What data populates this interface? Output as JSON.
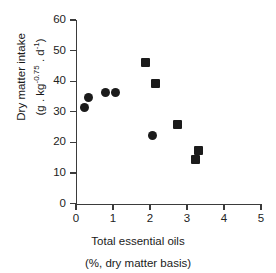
{
  "chart_data": {
    "type": "scatter",
    "title": "",
    "xlabel": "Total essential oils (%, dry matter basis)",
    "ylabel": "Dry matter intake (g . kg^-0.75 . d^-1)",
    "xlim": [
      0,
      5
    ],
    "ylim": [
      0,
      60
    ],
    "xticks": [
      0,
      1,
      2,
      3,
      4,
      5
    ],
    "yticks": [
      0,
      10,
      20,
      30,
      40,
      50,
      60
    ],
    "grid": false,
    "legend": "none",
    "series": [
      {
        "name": "circle-series",
        "marker": "circle",
        "color": "#1b1b1b",
        "points": [
          {
            "x": 0.22,
            "y": 31.3
          },
          {
            "x": 0.34,
            "y": 34.6
          },
          {
            "x": 0.81,
            "y": 36.3
          },
          {
            "x": 1.08,
            "y": 36.2
          },
          {
            "x": 2.06,
            "y": 22.4
          }
        ]
      },
      {
        "name": "square-series",
        "marker": "square",
        "color": "#1b1b1b",
        "points": [
          {
            "x": 1.88,
            "y": 46.0
          },
          {
            "x": 2.14,
            "y": 39.3
          },
          {
            "x": 2.74,
            "y": 25.8
          },
          {
            "x": 3.31,
            "y": 17.3
          },
          {
            "x": 3.22,
            "y": 14.4
          }
        ]
      }
    ]
  },
  "axes": {
    "y_title_line1": "Dry matter intake",
    "y_title_line2_prefix": "(g . kg",
    "y_title_line2_sup1": "-0.75",
    "y_title_line2_mid": " . d",
    "y_title_line2_sup2": "-1",
    "y_title_line2_suffix": ")",
    "x_title_line1": "Total essential oils",
    "x_title_line2": "(%, dry matter basis)",
    "ytick_labels": [
      "0",
      "10",
      "20",
      "30",
      "40",
      "50",
      "60"
    ],
    "xtick_labels": [
      "0",
      "1",
      "2",
      "3",
      "4",
      "5"
    ]
  },
  "style": {
    "marker_color": "#1b1b1b",
    "axis_color": "#3b3b3b",
    "background": "#ffffff"
  }
}
